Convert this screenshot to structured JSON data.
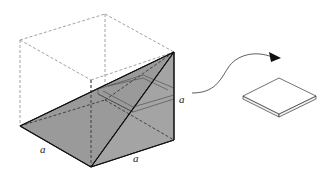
{
  "figure": {
    "labels": {
      "left_bottom_edge": "a",
      "front_bottom_edge": "a",
      "right_vertical_edge": "a"
    },
    "colors": {
      "shaded_face": "#9a9a9a",
      "dashed_edges": "#8a8a8a",
      "solid_edges": "#111111",
      "background": "#ffffff"
    }
  }
}
